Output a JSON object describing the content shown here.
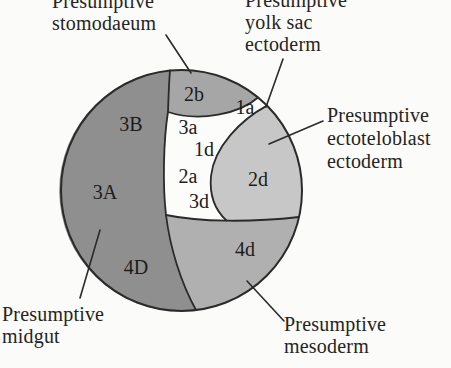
{
  "figure": {
    "background": "#fbfbf9",
    "outline_color": "#2a2a2a",
    "text_color": "#242424"
  },
  "regions": [
    {
      "name": "presumptive-midgut",
      "cells": "3A, 3B, 4D",
      "color": "#8f8f8f"
    },
    {
      "name": "presumptive-stomodaeum",
      "cells": "2b",
      "color": "#a6a6a6"
    },
    {
      "name": "presumptive-ectoteloblast-ectoderm",
      "cells": "2d",
      "color": "#c7c7c7"
    },
    {
      "name": "presumptive-mesoderm",
      "cells": "4d",
      "color": "#b0b0b0"
    },
    {
      "name": "presumptive-yolk-sac-ectoderm",
      "cells": "1a, 3a, 1d, 2a, 3d",
      "color": "#fcfcfa"
    }
  ],
  "cell_labels": [
    {
      "label": "3B"
    },
    {
      "label": "3A"
    },
    {
      "label": "4D"
    },
    {
      "label": "2b"
    },
    {
      "label": "3a"
    },
    {
      "label": "1d"
    },
    {
      "label": "2a"
    },
    {
      "label": "3d"
    },
    {
      "label": "1a"
    },
    {
      "label": "2d"
    },
    {
      "label": "4d"
    }
  ],
  "annotations": [
    {
      "id": "stomodaeum",
      "lines": [
        "Presumptive",
        "stomodaeum"
      ]
    },
    {
      "id": "yolk-sac",
      "lines": [
        "Presumptive",
        "yolk sac",
        "ectoderm"
      ]
    },
    {
      "id": "ectoteloblast",
      "lines": [
        "Presumptive",
        "ectoteloblast",
        "ectoderm"
      ]
    },
    {
      "id": "midgut",
      "lines": [
        "Presumptive",
        "midgut"
      ]
    },
    {
      "id": "mesoderm",
      "lines": [
        "Presumptive",
        "mesoderm"
      ]
    }
  ]
}
